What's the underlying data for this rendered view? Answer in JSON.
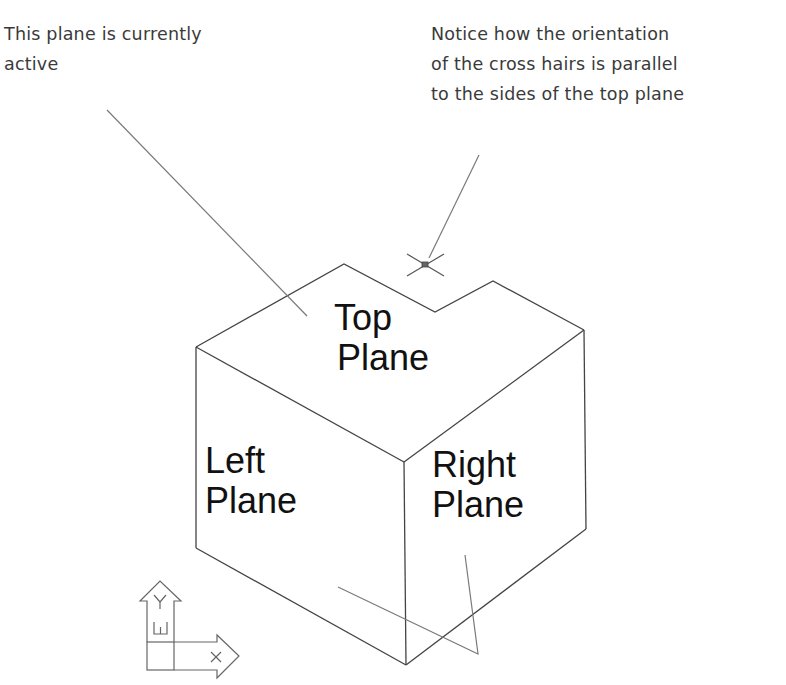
{
  "annotations": {
    "active_plane_note": {
      "lines": [
        "This plane is currently",
        "active"
      ]
    },
    "crosshair_note": {
      "lines": [
        "Notice how the orientation",
        "of the cross hairs is parallel",
        "to the sides of the top plane"
      ]
    }
  },
  "planes": {
    "top": {
      "lines": [
        "Top",
        "Plane"
      ]
    },
    "left": {
      "lines": [
        "Left",
        "Plane"
      ]
    },
    "right": {
      "lines": [
        "Right",
        "Plane"
      ]
    }
  },
  "ucs_icon": {
    "y_axis_label": "Y",
    "x_axis_label": "X",
    "plane_marker": "W"
  },
  "colors": {
    "outline": "#444444",
    "leader": "#7a7a7a",
    "text": "#111111",
    "note_text": "#3a3a3a"
  }
}
